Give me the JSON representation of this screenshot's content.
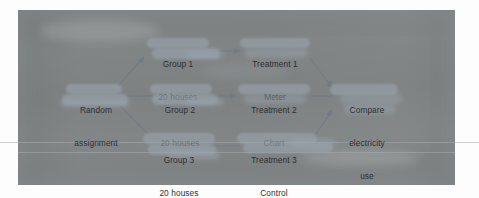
{
  "diagram": {
    "style": {
      "page_background": "#c9cbcb",
      "outer_background": "#fdfdfd",
      "highlight_color": "#9aa4ae",
      "text_color": "#2c2f33",
      "connector_color": "#6f7a86"
    },
    "nodes": [
      {
        "id": "random-assignment",
        "name": "random-assignment-node",
        "lines": [
          "Random",
          "assignment"
        ]
      },
      {
        "id": "group-1",
        "name": "group-1-node",
        "lines": [
          "Group 1",
          "20 houses"
        ]
      },
      {
        "id": "group-2",
        "name": "group-2-node",
        "lines": [
          "Group 2",
          "20 houses"
        ]
      },
      {
        "id": "group-3",
        "name": "group-3-node",
        "lines": [
          "Group 3",
          "20 houses"
        ]
      },
      {
        "id": "treatment-1",
        "name": "treatment-1-node",
        "lines": [
          "Treatment 1",
          "Meter"
        ]
      },
      {
        "id": "treatment-2",
        "name": "treatment-2-node",
        "lines": [
          "Treatment 2",
          "Chart"
        ]
      },
      {
        "id": "treatment-3",
        "name": "treatment-3-node",
        "lines": [
          "Treatment 3",
          "Control"
        ]
      },
      {
        "id": "compare",
        "name": "compare-outcome-node",
        "lines": [
          "Compare",
          "electricity",
          "use"
        ]
      }
    ],
    "edges": [
      {
        "from": "random-assignment",
        "to": "group-1",
        "kind": "arrow-up-right"
      },
      {
        "from": "random-assignment",
        "to": "group-2",
        "kind": "arrow-right"
      },
      {
        "from": "random-assignment",
        "to": "group-3",
        "kind": "line-down-right"
      },
      {
        "from": "group-1",
        "to": "treatment-1",
        "kind": "arrow-right"
      },
      {
        "from": "group-2",
        "to": "treatment-2",
        "kind": "arrow-right"
      },
      {
        "from": "group-3",
        "to": "treatment-3",
        "kind": "line-right"
      },
      {
        "from": "treatment-1",
        "to": "compare",
        "kind": "arrow-down-right"
      },
      {
        "from": "treatment-2",
        "to": "compare",
        "kind": "line-right"
      },
      {
        "from": "treatment-3",
        "to": "compare",
        "kind": "arrow-up-right"
      }
    ]
  }
}
